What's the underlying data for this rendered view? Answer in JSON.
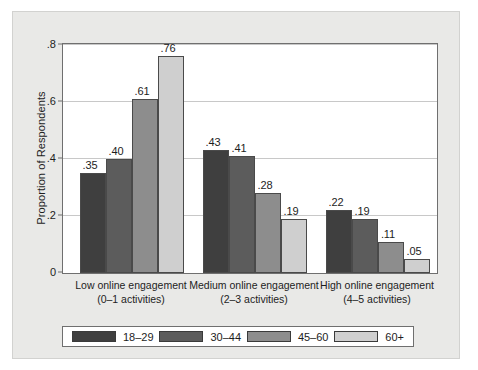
{
  "chart_data": {
    "type": "bar",
    "title": "",
    "subtitle": "",
    "xlabel": "",
    "ylabel": "Proportion of Respondents",
    "ylim": [
      0,
      0.8
    ],
    "yticks": [
      0,
      0.2,
      0.4,
      0.6,
      0.8
    ],
    "ytick_labels": [
      "0",
      ".2",
      ".4",
      ".6",
      ".8"
    ],
    "grid": true,
    "legend_position": "bottom",
    "categories": [
      "Low online engagement\n(0–1 activities)",
      "Medium online engagement\n(2–3 activities)",
      "High online engagement\n(4–5 activities)"
    ],
    "category_lines": [
      [
        "Low online engagement",
        "(0–1 activities)"
      ],
      [
        "Medium online engagement",
        "(2–3 activities)"
      ],
      [
        "High online engagement",
        "(4–5 activities)"
      ]
    ],
    "series": [
      {
        "name": "18–29",
        "color": "#3f3f3f",
        "values": [
          0.35,
          0.43,
          0.22
        ],
        "labels": [
          ".35",
          ".43",
          ".22"
        ]
      },
      {
        "name": "30–44",
        "color": "#5c5c5c",
        "values": [
          0.4,
          0.41,
          0.19
        ],
        "labels": [
          ".40",
          ".41",
          ".19"
        ]
      },
      {
        "name": "45–60",
        "color": "#8d8d8d",
        "values": [
          0.61,
          0.28,
          0.11
        ],
        "labels": [
          ".61",
          ".28",
          ".11"
        ]
      },
      {
        "name": "60+",
        "color": "#cfcfcf",
        "values": [
          0.76,
          0.19,
          0.05
        ],
        "labels": [
          ".76",
          ".19",
          ".05"
        ]
      }
    ]
  },
  "legend": {
    "entries": [
      {
        "label": "18–29",
        "color": "#3f3f3f"
      },
      {
        "label": "30–44",
        "color": "#5c5c5c"
      },
      {
        "label": "45–60",
        "color": "#8d8d8d"
      },
      {
        "label": "60+",
        "color": "#cfcfcf"
      }
    ]
  }
}
